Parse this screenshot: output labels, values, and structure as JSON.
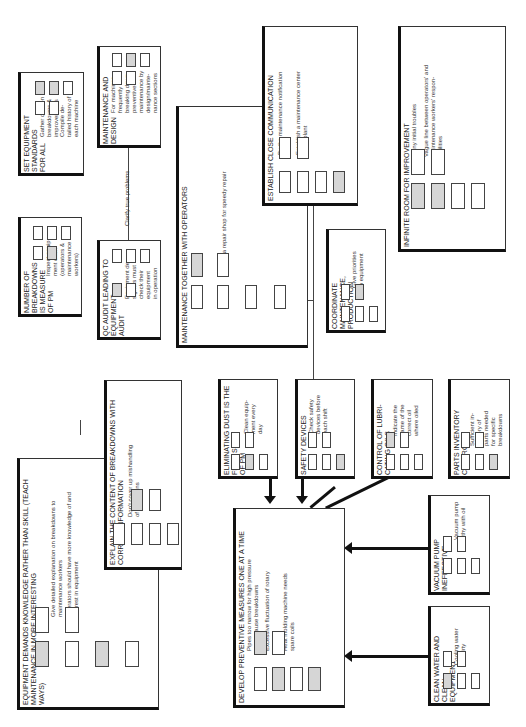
{
  "diagram": {
    "title": "",
    "panels": {
      "equipment_standards": {
        "title": "SET EQUIPMENT STANDARDS\nFOR ALL",
        "notes": [
          "Gather data on\nbreakdowns &\nimprovements",
          "Compile de-\ntailed history of\neach machine"
        ]
      },
      "maintenance_design": {
        "title": "MAINTENANCE AND DESIGN",
        "notes": [
          "For machines\nfrequently\nbreaking down,\npreventive\nmaintenance by\ndesign/mainte-\nnance sections"
        ]
      },
      "breakdowns_measure": {
        "title": "NUMBER OF BREAKDOWNS\nIS MEASURE\nOF PM",
        "notes": [
          "Inspect equip-\nment often\n(operators &\nmaintenance\nworkers)"
        ]
      },
      "qc_audit": {
        "title": "QC AUDIT LEADING TO\nEQUIPMENT\nAUDIT",
        "notes": [
          "Equipment de-\nsigners must\ncheck their\nequipment\nin operation"
        ]
      },
      "maintenance_operators": {
        "title": "MAINTENANCE TOGETHER WITH OPERATORS",
        "notes": [
          "Have a repair shop for speedy repair"
        ]
      },
      "close_communication": {
        "title": "ESTABLISH CLOSE COMMUNICATION",
        "notes": [
          "By the maintenance notification\nboard",
          "Establish a maintenance center\nin the plant"
        ]
      },
      "coordinate": {
        "title": "COORDINATE MAINTENANCE,\nPRODUCTION",
        "notes": [
          "Give priorities\nto equipment"
        ]
      },
      "infinite_room": {
        "title": "INFINITE ROOM FOR IMPROVEMENT",
        "notes": [
          "Many initial troubles",
          "Vague line between operators' and\nmaintenance workers' respon-\nsibilities"
        ]
      },
      "knowledge_skill": {
        "title": "EQUIPMENT DEMANDS KNOWLEDGE RATHER THAN SKILL (TEACH\nMAINTENANCE IN MORE INTERESTING\nWAYS)",
        "notes": [
          "Give detailed explanation on breakdowns to\nmaintenance workers",
          "Operators should have more knowledge of and\ninterest in equipment"
        ]
      },
      "explain_content": {
        "title": "EXPLAIN THE CONTENT OF BREAKDOWNS WITH\nCORRECT INFORMATION",
        "notes": [
          "Don't cover up mishandling\nof operations"
        ]
      },
      "eliminating_dust": {
        "title": "ELIMINATING DUST IS THE\nFIRST STEP\nOF PM",
        "notes": [
          "Clean equip-\nment every\nday"
        ]
      },
      "safety": {
        "title": "SAFETY DEVICES",
        "notes": [
          "Check safety\ndevices before\neach shift"
        ]
      },
      "lubricating": {
        "title": "CONTROL OF LUBRI-\nCATING OILS",
        "notes": [
          "Indicate the\nname of the\ncorrect oil\nwhere oiled"
        ]
      },
      "parts_inventory": {
        "title": "PARTS INVENTORY\nCONTROL",
        "notes": [
          "Sufficient in-\nventory of\nparts needed\nfor specific\nbreakdowns"
        ]
      },
      "preventive": {
        "title": "DEVELOP PREVENTIVE MEASURES ONE AT A TIME",
        "notes": [
          "Pipes too narrow for high pressure\nwater cause breakdowns",
          "Excessive fluctuation of rotary\npumps",
          "Heat molding machine needs\nspare coils"
        ]
      },
      "vacuum": {
        "title": "VACUUM PUMP\nINEFFECTIVE",
        "notes": [
          "Vacuum pump\nfilthy with oil"
        ]
      },
      "clean_water": {
        "title": "CLEAN WATER AND\nCLEAN\nEQUIPMENT",
        "notes": [
          "Cooling water\ntoo dirty"
        ]
      }
    },
    "connector_labels": {
      "clarify": "Clarify true problems"
    },
    "colors": {
      "ink": "#222222",
      "shaded_box": "#d6d6d6",
      "heavy_border": "#111111"
    }
  }
}
